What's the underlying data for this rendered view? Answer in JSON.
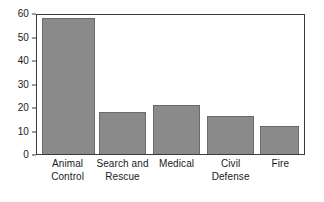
{
  "chart_data": {
    "type": "bar",
    "title": "",
    "subtitle": "",
    "xlabel": "",
    "ylabel": "",
    "categories": [
      "Animal\nControl",
      "Search and\nRescue",
      "Medical",
      "Civil\nDefense",
      "Fire"
    ],
    "values": [
      58,
      18,
      21,
      16,
      12
    ],
    "ylim": [
      0,
      60
    ],
    "yticks": [
      0,
      10,
      20,
      30,
      40,
      50,
      60
    ],
    "ytick_labels": [
      "0",
      "10",
      "20",
      "30",
      "40",
      "50",
      "60"
    ],
    "grid": false,
    "legend": null,
    "bar_fill_color": "#8a8a8a",
    "bar_edge_color": "#6a6a6a",
    "axis_color": "#3c3c3c",
    "background_color": "#ffffff",
    "bars": [
      {
        "category": "Animal\nControl",
        "value": 58,
        "x_left_pct": 1.9,
        "width_pct": 19.7
      },
      {
        "category": "Search and\nRescue",
        "value": 18,
        "x_left_pct": 23.4,
        "width_pct": 17.5
      },
      {
        "category": "Medical",
        "value": 21,
        "x_left_pct": 43.5,
        "width_pct": 17.5
      },
      {
        "category": "Civil\nDefense",
        "value": 16,
        "x_left_pct": 63.6,
        "width_pct": 17.5
      },
      {
        "category": "Fire",
        "value": 12,
        "x_left_pct": 83.6,
        "width_pct": 14.5
      }
    ]
  }
}
